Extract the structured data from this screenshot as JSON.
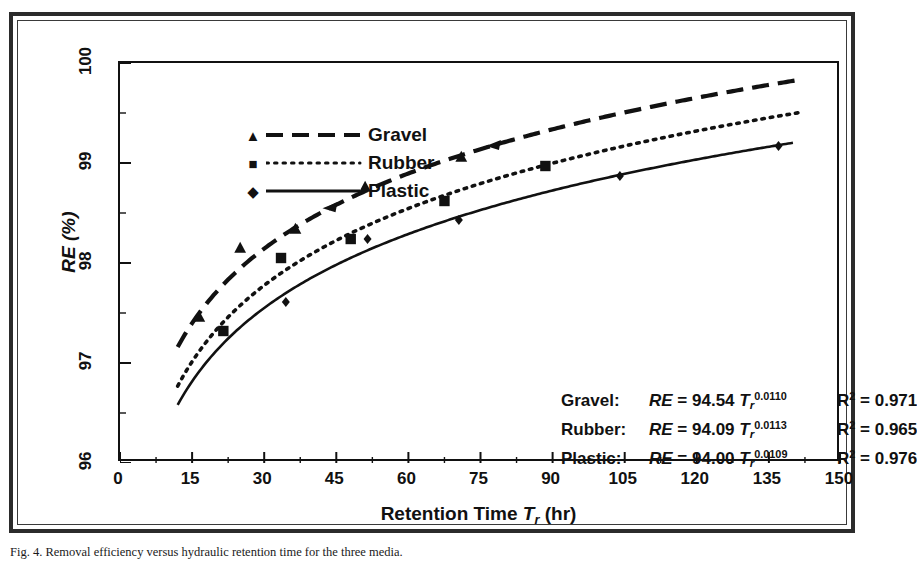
{
  "figure": {
    "caption": "Fig. 4. Removal efficiency versus hydraulic retention time for the three media.",
    "frame_color": "#2b2b2b"
  },
  "chart_data": {
    "type": "line",
    "title": "",
    "xlabel": "Retention Time T_r (hr)",
    "ylabel": "RE (%)",
    "xlim": [
      0,
      150
    ],
    "ylim": [
      96,
      100
    ],
    "xticks": [
      0,
      15,
      30,
      45,
      60,
      75,
      90,
      105,
      120,
      135,
      150
    ],
    "yticks": [
      96,
      97,
      98,
      99,
      100
    ],
    "x_minor_step": 7.5,
    "y_minor_step": 0.5,
    "grid": false,
    "legend_position": "top-left",
    "series": [
      {
        "name": "Gravel",
        "marker": "triangle",
        "linestyle": "dashed",
        "color": "#111111",
        "equation_coefficient": 94.54,
        "equation_exponent": 0.011,
        "r_squared": 0.971,
        "curve_x_start": 12,
        "curve_x_end": 142,
        "points": [
          {
            "x": 16.5,
            "y": 97.46
          },
          {
            "x": 25.0,
            "y": 98.15
          },
          {
            "x": 36.5,
            "y": 98.34
          },
          {
            "x": 51.0,
            "y": 98.76
          },
          {
            "x": 71.0,
            "y": 99.06
          }
        ]
      },
      {
        "name": "Rubber",
        "marker": "square",
        "linestyle": "dotted",
        "color": "#111111",
        "equation_coefficient": 94.09,
        "equation_exponent": 0.0113,
        "r_squared": 0.965,
        "curve_x_start": 12,
        "curve_x_end": 142,
        "points": [
          {
            "x": 21.5,
            "y": 97.32
          },
          {
            "x": 33.5,
            "y": 98.05
          },
          {
            "x": 48.0,
            "y": 98.24
          },
          {
            "x": 67.5,
            "y": 98.62
          },
          {
            "x": 88.5,
            "y": 98.97
          }
        ]
      },
      {
        "name": "Plastic",
        "marker": "diamond",
        "linestyle": "solid",
        "color": "#111111",
        "equation_coefficient": 94.0,
        "equation_exponent": 0.0109,
        "r_squared": 0.976,
        "curve_x_start": 12,
        "curve_x_end": 140,
        "points": [
          {
            "x": 34.5,
            "y": 97.61
          },
          {
            "x": 51.5,
            "y": 98.24
          },
          {
            "x": 70.5,
            "y": 98.43
          },
          {
            "x": 104.0,
            "y": 98.87
          },
          {
            "x": 137.0,
            "y": 99.17
          }
        ]
      }
    ]
  },
  "legend": {
    "items": [
      {
        "label": "Gravel",
        "marker": "triangle",
        "linestyle": "dashed"
      },
      {
        "label": "Rubber",
        "marker": "square",
        "linestyle": "dotted"
      },
      {
        "label": "Plastic",
        "marker": "diamond",
        "linestyle": "solid"
      }
    ]
  },
  "axes": {
    "x_title_main": "Retention Time",
    "x_title_var": "T",
    "x_title_sub": "r",
    "x_title_unit": "(hr)",
    "y_title": "RE (%)",
    "xticks": [
      "0",
      "15",
      "30",
      "45",
      "60",
      "75",
      "90",
      "105",
      "120",
      "135",
      "150"
    ],
    "yticks": [
      "100",
      "99",
      "98",
      "97",
      "96"
    ]
  },
  "equations": {
    "rows": [
      {
        "name": "Gravel:",
        "lhs": "RE",
        "eq": "=",
        "coefficient": "94.54",
        "variable": "T",
        "subscript": "r",
        "exponent": "0.0110",
        "r2_label": "R",
        "r2_sup": "2",
        "r2_value": "= 0.971"
      },
      {
        "name": "Rubber:",
        "lhs": "RE",
        "eq": "=",
        "coefficient": "94.09",
        "variable": "T",
        "subscript": "r",
        "exponent": "0.0113",
        "r2_label": "R",
        "r2_sup": "2",
        "r2_value": "= 0.965"
      },
      {
        "name": "Plastic:",
        "lhs": "RE",
        "eq": "=",
        "coefficient": "94.00",
        "variable": "T",
        "subscript": "r",
        "exponent": "0.0109",
        "r2_label": "R",
        "r2_sup": "2",
        "r2_value": "= 0.976"
      }
    ]
  }
}
